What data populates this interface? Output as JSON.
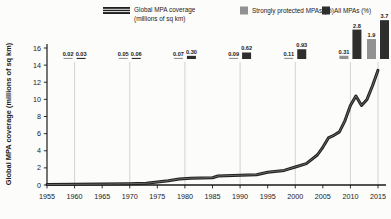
{
  "colors": {
    "background": "#fcfcfb",
    "line": "#1f1f1f",
    "line_core": "#787878",
    "bar_strong": "#929292",
    "bar_all": "#2e2e2e",
    "gridline": "#c9c9c9",
    "axis": "#1a1a1a",
    "text": "#1a1a1a"
  },
  "legend": {
    "line_item": {
      "label_line1": "Global MPA coverage",
      "label_line2": "(millions of sq km)"
    },
    "strong_item": {
      "label": "Strongly protected MPAs (%)"
    },
    "all_item": {
      "label": "All MPAs (%)"
    }
  },
  "chart_data": {
    "type": "line+bar combo",
    "title": "",
    "xlabel": "",
    "ylabel": "Global MPA coverage (millions of sq km)",
    "ylim": [
      0,
      16
    ],
    "y_ticks": [
      0,
      2,
      4,
      6,
      8,
      10,
      12,
      14,
      16
    ],
    "x_ticks": [
      1955,
      1960,
      1965,
      1970,
      1975,
      1980,
      1985,
      1990,
      1995,
      2000,
      2005,
      2010,
      2015
    ],
    "grid_years": [
      1960,
      1970,
      1980,
      1990,
      2000,
      2010,
      2015
    ],
    "grid_on": true,
    "legend_position": "top",
    "line_series": {
      "name": "Global MPA coverage (millions of sq km)",
      "points": [
        [
          1955,
          0.05
        ],
        [
          1960,
          0.08
        ],
        [
          1965,
          0.1
        ],
        [
          1970,
          0.15
        ],
        [
          1973,
          0.2
        ],
        [
          1975,
          0.35
        ],
        [
          1977,
          0.5
        ],
        [
          1979,
          0.7
        ],
        [
          1981,
          0.8
        ],
        [
          1985,
          0.85
        ],
        [
          1986,
          1.05
        ],
        [
          1990,
          1.15
        ],
        [
          1993,
          1.2
        ],
        [
          1995,
          1.5
        ],
        [
          1998,
          1.7
        ],
        [
          2000,
          2.1
        ],
        [
          2002,
          2.5
        ],
        [
          2004,
          3.5
        ],
        [
          2005,
          4.4
        ],
        [
          2006,
          5.5
        ],
        [
          2007,
          5.8
        ],
        [
          2008,
          6.2
        ],
        [
          2009,
          7.5
        ],
        [
          2010,
          9.3
        ],
        [
          2011,
          10.4
        ],
        [
          2012,
          9.3
        ],
        [
          2013,
          10.0
        ],
        [
          2014,
          11.6
        ],
        [
          2015,
          13.4
        ]
      ]
    },
    "bar_series": {
      "categories": [
        1960,
        1970,
        1980,
        1990,
        2000,
        2010,
        2015
      ],
      "series": [
        {
          "name": "Strongly protected MPAs (%)",
          "labels": [
            "0.02",
            "0.05",
            "0.07",
            "0.09",
            "0.11",
            "0.31",
            "1.9"
          ],
          "values": [
            0.02,
            0.05,
            0.07,
            0.09,
            0.11,
            0.31,
            1.9
          ]
        },
        {
          "name": "All MPAs (%)",
          "labels": [
            "0.03",
            "0.06",
            "0.30",
            "0.62",
            "0.93",
            "2.8",
            "3.7"
          ],
          "values": [
            0.03,
            0.06,
            0.3,
            0.62,
            0.93,
            2.8,
            3.7
          ]
        }
      ]
    }
  }
}
